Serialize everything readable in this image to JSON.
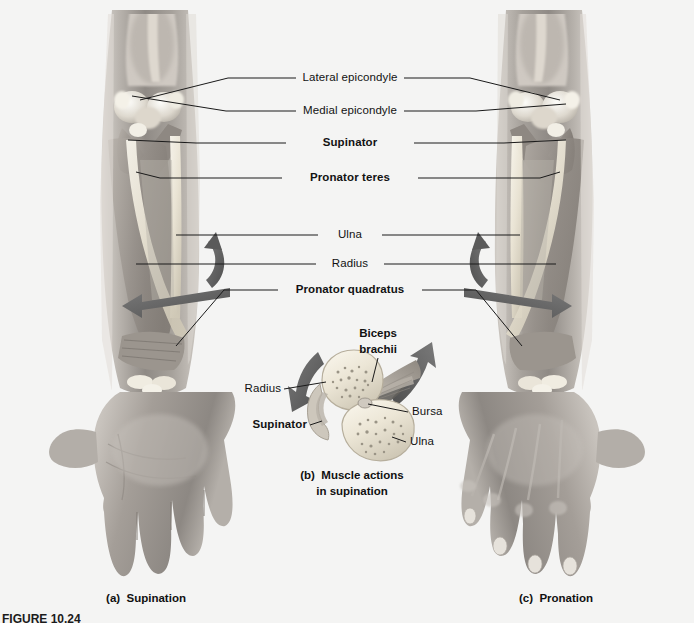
{
  "figure": {
    "number_label": "FIGURE 10.24",
    "background_color": "#f4f4f3"
  },
  "labels": {
    "lateral_epicondyle": "Lateral epicondyle",
    "medial_epicondyle": "Medial epicondyle",
    "supinator": "Supinator",
    "pronator_teres": "Pronator teres",
    "ulna": "Ulna",
    "radius": "Radius",
    "pronator_quadratus": "Pronator quadratus"
  },
  "inset": {
    "biceps_brachii": "Biceps\nbrachii",
    "radius": "Radius",
    "supinator": "Supinator",
    "bursa": "Bursa",
    "ulna": "Ulna"
  },
  "captions": {
    "panel_a": "(a)  Supination",
    "panel_b": "(b)  Muscle actions\nin supination",
    "panel_c": "(c)  Pronation"
  },
  "colors": {
    "leader_line": "#1a1a1a",
    "arrow_gray": "#6b6b6b",
    "arrow_dark": "#4d4d4d",
    "bone_fill": "#e8e2d4",
    "skin_mid": "#a8a39e",
    "text": "#121212"
  }
}
